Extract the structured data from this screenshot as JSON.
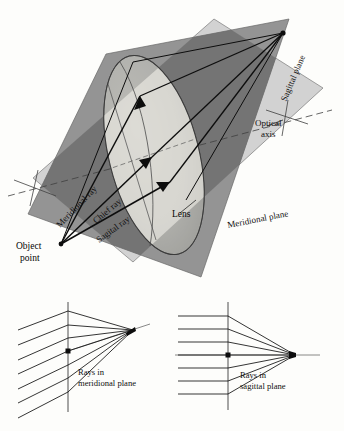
{
  "figure": {
    "background_color": "#fdfdfb",
    "ink_color": "#111111"
  },
  "colors": {
    "meridional_plane_fill": "#d2d2d2",
    "sagittal_plane_fill": "#8d8d8d",
    "sagittal_plane_dark_fill": "#6f6f6f",
    "lens_light_fill": "#efeee8",
    "lens_mid_fill": "#c9c9c4",
    "lens_dark_fill": "#9a9a96",
    "ray_color": "#0d0d0d",
    "axis_color": "#4a4a4a"
  },
  "main_diagram": {
    "name": "three-dimensional-lens-plane-diagram",
    "labels": {
      "object_point_line1": "Object",
      "object_point_line2": "point",
      "meridional_ray": "Meridional ray",
      "chief_ray": "Chief ray",
      "sagittal_ray": "Sagital ray",
      "lens": "Lens",
      "optical_axis_line1": "Optical",
      "optical_axis_line2": "axis",
      "sagittal_plane": "Sagittal plane",
      "meridional_plane": "Meridional plane"
    },
    "geometry": {
      "object_point": [
        61,
        244
      ],
      "image_point": [
        283,
        33
      ],
      "lens_center": [
        154,
        155
      ],
      "ray_count": 3
    }
  },
  "sub_diagrams": [
    {
      "name": "rays-in-meridional-plane",
      "caption_line1": "Rays in",
      "caption_line2": "meridional plane",
      "ray_count": 7,
      "focus": [
        133,
        330
      ],
      "axis_dot": [
        68,
        351
      ],
      "lens_line_x": 68,
      "incoming_direction": "oblique-from-lower-left",
      "focus_type": "astigmatic-line-focus"
    },
    {
      "name": "rays-in-sagittal-plane",
      "caption_line1": "Rays in",
      "caption_line2": "sagittal plane",
      "ray_count": 7,
      "focus": [
        295,
        355
      ],
      "axis_dot": [
        228,
        355
      ],
      "lens_line_x": 228,
      "incoming_direction": "horizontal-parallel",
      "focus_type": "point-focus-on-axis"
    }
  ]
}
